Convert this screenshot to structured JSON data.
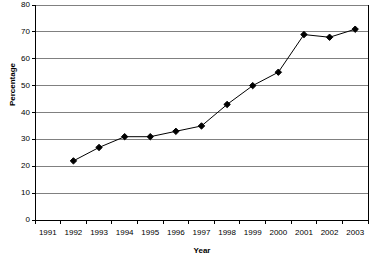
{
  "chart_data": {
    "type": "line",
    "title": "",
    "xlabel": "Year",
    "ylabel": "Percentage",
    "categories": [
      "1991",
      "1992",
      "1993",
      "1994",
      "1995",
      "1996",
      "1997",
      "1998",
      "1999",
      "2000",
      "2001",
      "2002",
      "2003"
    ],
    "values": [
      null,
      22,
      27,
      31,
      31,
      33,
      35,
      43,
      50,
      55,
      69,
      68,
      71
    ],
    "series": [
      {
        "name": "Percentage",
        "values": [
          null,
          22,
          27,
          31,
          31,
          33,
          35,
          43,
          50,
          55,
          69,
          68,
          71
        ]
      }
    ],
    "ylim": [
      0,
      80
    ],
    "ytick_step": 10,
    "yticks": [
      "0",
      "10",
      "20",
      "30",
      "40",
      "50",
      "60",
      "70",
      "80"
    ],
    "grid": true,
    "grid_axis": "y",
    "legend": "none",
    "marker": "diamond",
    "line_color": "#000000",
    "marker_color": "#000000",
    "grid_color": "#808080",
    "axis_color": "#000000",
    "plot_background": "#ffffff"
  },
  "axes": {
    "y_title": "Percentage",
    "x_title": "Year"
  }
}
